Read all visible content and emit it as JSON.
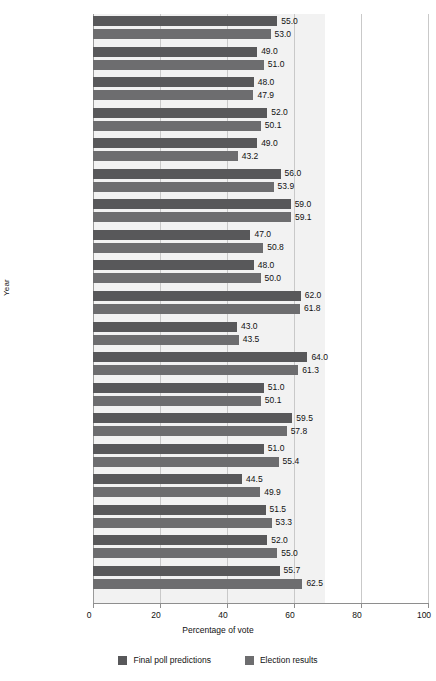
{
  "chart_data": {
    "type": "bar",
    "orientation": "horizontal",
    "title": "",
    "xlabel": "Percentage of vote",
    "ylabel": "Year",
    "xlim": [
      0,
      100
    ],
    "xticks": [
      0,
      20,
      40,
      60,
      80,
      100
    ],
    "grid": true,
    "legend_position": "bottom",
    "categories": [
      {
        "year": "2008",
        "candidate": "Obama"
      },
      {
        "year": "2004",
        "candidate": "Bush, G.W."
      },
      {
        "year": "2000",
        "candidate": "Bush, G.W."
      },
      {
        "year": "1996",
        "candidate": "Clinton"
      },
      {
        "year": "1992",
        "candidate": "Clinton"
      },
      {
        "year": "1988",
        "candidate": "Bush, G.H.W."
      },
      {
        "year": "1984",
        "candidate": "Reagan"
      },
      {
        "year": "1980",
        "candidate": "Reagan"
      },
      {
        "year": "1976",
        "candidate": "Carter"
      },
      {
        "year": "1972",
        "candidate": "Nixon"
      },
      {
        "year": "1968",
        "candidate": "Nixon"
      },
      {
        "year": "1964",
        "candidate": "Johnson"
      },
      {
        "year": "1960",
        "candidate": "Kennedy"
      },
      {
        "year": "1956",
        "candidate": "Eisenhower"
      },
      {
        "year": "1952",
        "candidate": "Eisenhower"
      },
      {
        "year": "1948",
        "candidate": "Truman"
      },
      {
        "year": "1944",
        "candidate": "Roosevelt, F.D."
      },
      {
        "year": "1940",
        "candidate": "Roosevelt, F.D."
      },
      {
        "year": "1936",
        "candidate": "Roosevelt, F.D."
      }
    ],
    "series": [
      {
        "name": "Final poll predictions",
        "color": "#58585a",
        "values": [
          55.0,
          49.0,
          48.0,
          52.0,
          49.0,
          56.0,
          59.0,
          47.0,
          48.0,
          62.0,
          43.0,
          64.0,
          51.0,
          59.5,
          51.0,
          44.5,
          51.5,
          52.0,
          55.7
        ],
        "labels": [
          "55.0",
          "49.0",
          "48.0",
          "52.0",
          "49.0",
          "56.0",
          "59.0",
          "47.0",
          "48.0",
          "62.0",
          "43.0",
          "64.0",
          "51.0",
          "59.5",
          "51.0",
          "44.5",
          "51.5",
          "52.0",
          "55.7"
        ]
      },
      {
        "name": "Election results",
        "color": "#6d6d6f",
        "values": [
          53.0,
          51.0,
          47.9,
          50.1,
          43.2,
          53.9,
          59.1,
          50.8,
          50.0,
          61.8,
          43.5,
          61.3,
          50.1,
          57.8,
          55.4,
          49.9,
          53.3,
          55.0,
          62.5
        ],
        "labels": [
          "53.0",
          "51.0",
          "47.9",
          "50.1",
          "43.2",
          "53.9",
          "59.1",
          "50.8",
          "50.0",
          "61.8",
          "43.5",
          "61.3",
          "50.1",
          "57.8",
          "55.4",
          "49.9",
          "53.3",
          "55.0",
          "62.5"
        ]
      }
    ]
  },
  "axes": {
    "y_title": "Year",
    "x_title": "Percentage of vote",
    "x_tick_labels": [
      "0",
      "20",
      "40",
      "60",
      "80",
      "100"
    ]
  },
  "legend": {
    "items": [
      {
        "label": "Final poll predictions",
        "swatch": "legend-swatch-poll"
      },
      {
        "label": "Election results",
        "swatch": "legend-swatch-results"
      }
    ]
  }
}
